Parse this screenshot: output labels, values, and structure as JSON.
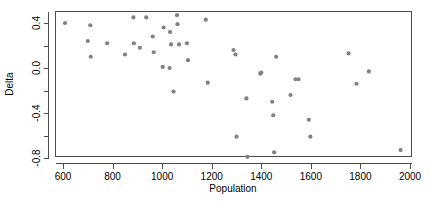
{
  "chart_data": {
    "type": "scatter",
    "title": "",
    "xlabel": "Population",
    "ylabel": "Delta",
    "xlim": [
      530,
      2040
    ],
    "ylim": [
      -0.93,
      0.58
    ],
    "grid": false,
    "legend": null,
    "point_color": "#808080",
    "point_marker": "filled-circle",
    "axis_color": "#4d4d4d",
    "xticks": [
      600,
      800,
      1000,
      1200,
      1400,
      1600,
      1800,
      2000
    ],
    "xtick_labels": [
      "600",
      "800",
      "1000",
      "1200",
      "1400",
      "1600",
      "1800",
      "2000"
    ],
    "yticks": [
      0.4,
      0.0,
      -0.4,
      -0.8
    ],
    "ytick_labels": [
      "0.4",
      "0.0",
      "-0.4",
      "-0.8"
    ],
    "y_minor_ticks": [
      0.2,
      -0.2,
      -0.6
    ],
    "x": [
      608,
      700,
      710,
      712,
      778,
      850,
      884,
      886,
      910,
      936,
      962,
      966,
      1002,
      1006,
      1030,
      1032,
      1036,
      1046,
      1060,
      1062,
      1068,
      1100,
      1104,
      1176,
      1184,
      1288,
      1296,
      1300,
      1340,
      1344,
      1396,
      1400,
      1444,
      1448,
      1452,
      1460,
      1518,
      1538,
      1550,
      1592,
      1598,
      1752,
      1784,
      1834,
      1962
    ],
    "y": [
      0.4,
      0.24,
      0.38,
      0.1,
      0.22,
      0.12,
      0.45,
      0.22,
      0.18,
      0.45,
      0.28,
      0.14,
      0.01,
      0.36,
      0.0,
      0.32,
      0.21,
      -0.21,
      0.47,
      0.39,
      0.21,
      0.22,
      0.07,
      0.43,
      -0.13,
      0.16,
      0.12,
      -0.61,
      -0.27,
      -0.79,
      -0.05,
      -0.04,
      -0.3,
      -0.42,
      -0.75,
      0.1,
      -0.24,
      -0.1,
      -0.1,
      -0.46,
      -0.61,
      0.13,
      -0.14,
      -0.03,
      -0.73
    ],
    "n_points": 45
  },
  "axes": {
    "y_title": "Delta",
    "x_title": "Population"
  }
}
